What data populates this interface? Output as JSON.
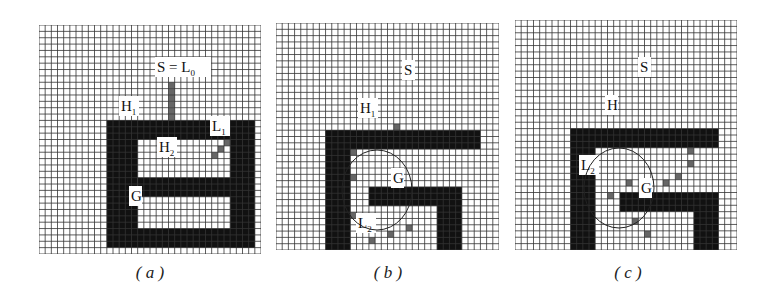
{
  "figure": {
    "grid_cells": 36,
    "colors": {
      "grid_line": "#333333",
      "obstacle": "#111111",
      "path": "#666666",
      "background": "#ffffff"
    },
    "panels": [
      {
        "id": "a",
        "caption": "( a )",
        "x": 39,
        "y": 25,
        "w": 222,
        "h": 229,
        "obstacles": [
          [
            11,
            15,
            5,
            19
          ],
          [
            11,
            15,
            24,
            3
          ],
          [
            11,
            32,
            24,
            3
          ],
          [
            31,
            15,
            4,
            20
          ],
          [
            16,
            24,
            16,
            3
          ]
        ],
        "path_cells": [
          [
            21,
            9
          ],
          [
            21,
            10
          ],
          [
            21,
            11
          ],
          [
            21,
            12
          ],
          [
            21,
            13
          ],
          [
            21,
            14
          ],
          [
            31,
            17
          ],
          [
            30,
            18
          ],
          [
            29,
            19
          ],
          [
            28,
            20
          ]
        ],
        "labels": [
          {
            "text": "S = L",
            "sub": "0",
            "x": 118,
            "y": 47
          },
          {
            "text": "H",
            "sub": "1",
            "x": 82,
            "y": 86
          },
          {
            "text": "L",
            "sub": "1",
            "x": 173,
            "y": 106
          },
          {
            "text": "H",
            "sub": "2",
            "x": 120,
            "y": 127
          },
          {
            "text": "G",
            "sub": "",
            "x": 92,
            "y": 176
          }
        ]
      },
      {
        "id": "b",
        "caption": "( b )",
        "x": 276,
        "y": 23,
        "w": 223,
        "h": 227,
        "obstacles": [
          [
            8,
            17,
            4,
            24
          ],
          [
            8,
            17,
            25,
            3
          ],
          [
            15,
            26,
            15,
            3
          ],
          [
            26,
            26,
            4,
            13
          ],
          [
            12,
            36,
            18,
            3
          ]
        ],
        "path_cells": [
          [
            19,
            16
          ],
          [
            12,
            20
          ],
          [
            12,
            24
          ],
          [
            12,
            30
          ],
          [
            15,
            34
          ],
          [
            18,
            33
          ],
          [
            21,
            32
          ]
        ],
        "labels": [
          {
            "text": "S",
            "sub": "",
            "x": 128,
            "y": 52
          },
          {
            "text": "H",
            "sub": "1",
            "x": 84,
            "y": 90
          },
          {
            "text": "G",
            "sub": "",
            "x": 117,
            "y": 160
          },
          {
            "text": "L",
            "sub": "2",
            "x": 82,
            "y": 205
          }
        ]
      },
      {
        "id": "c",
        "caption": "( c )",
        "x": 515,
        "y": 20,
        "w": 222,
        "h": 230,
        "obstacles": [
          [
            9,
            17,
            4,
            22
          ],
          [
            9,
            17,
            24,
            3
          ],
          [
            17,
            27,
            16,
            3
          ],
          [
            29,
            27,
            4,
            12
          ],
          [
            13,
            36,
            20,
            3
          ]
        ],
        "path_cells": [
          [
            28,
            20
          ],
          [
            28,
            22
          ],
          [
            26,
            24
          ],
          [
            24,
            25
          ],
          [
            18,
            25
          ],
          [
            15,
            27
          ],
          [
            17,
            29
          ],
          [
            19,
            31
          ],
          [
            21,
            33
          ]
        ],
        "labels": [
          {
            "text": "S",
            "sub": "",
            "x": 125,
            "y": 52
          },
          {
            "text": "H",
            "sub": "",
            "x": 92,
            "y": 90
          },
          {
            "text": "L",
            "sub": "2",
            "x": 66,
            "y": 150
          },
          {
            "text": "G",
            "sub": "",
            "x": 126,
            "y": 173
          }
        ]
      }
    ]
  }
}
